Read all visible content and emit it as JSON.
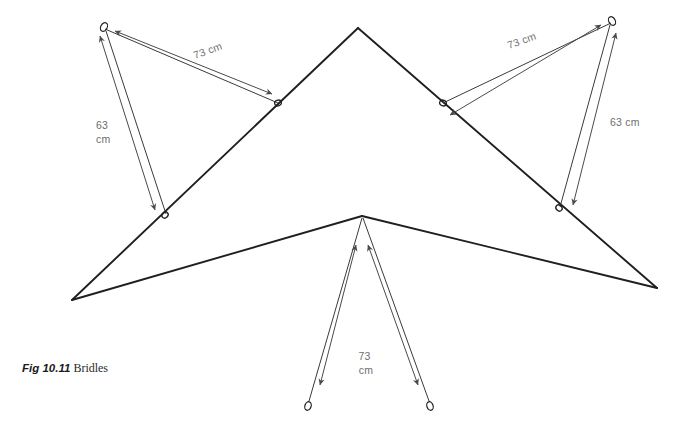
{
  "figure": {
    "label": "Fig 10.11",
    "title": "Bridles",
    "caption_full": "Fig 10.11 Bridles"
  },
  "colors": {
    "background": "#ffffff",
    "outline": "#1f1f1f",
    "bridle_line": "#3a3a3a",
    "dimension_line": "#4a4a4a",
    "dimension_text": "#6e6e6e",
    "caption_label": "#1a1a1a",
    "caption_text": "#2b2b2b"
  },
  "dimensions": {
    "left_upper": {
      "value": "73 cm",
      "number": 73,
      "unit": "cm",
      "lines": [
        "73 cm"
      ],
      "rotation": -20
    },
    "left_lower": {
      "value": "63 cm",
      "number": 63,
      "unit": "cm",
      "lines": [
        "63",
        "cm"
      ],
      "rotation": 0
    },
    "right_upper": {
      "value": "73 cm",
      "number": 73,
      "unit": "cm",
      "lines": [
        "73 cm"
      ],
      "rotation": 20
    },
    "right_lower": {
      "value": "63 cm",
      "number": 63,
      "unit": "cm",
      "lines": [
        "63 cm"
      ],
      "rotation": 0
    },
    "keel": {
      "value": "73 cm",
      "number": 73,
      "unit": "cm",
      "lines": [
        "73",
        "cm"
      ],
      "rotation": 0
    }
  },
  "kite": {
    "name": "delta-kite-outline",
    "apex": {
      "x": 358,
      "y": 28
    },
    "left_wingtip": {
      "x": 72,
      "y": 300
    },
    "right_wingtip": {
      "x": 657,
      "y": 288
    },
    "keel_point": {
      "x": 362,
      "y": 216
    }
  },
  "bridle_points": {
    "left_free_ring": {
      "x": 104,
      "y": 27
    },
    "left_upper_ring": {
      "x": 278,
      "y": 103
    },
    "left_lower_ring": {
      "x": 165,
      "y": 215
    },
    "right_free_ring": {
      "x": 612,
      "y": 21
    },
    "right_upper_ring": {
      "x": 443,
      "y": 103
    },
    "right_lower_ring": {
      "x": 559,
      "y": 208
    },
    "keel_left_loop": {
      "x": 308,
      "y": 406
    },
    "keel_right_loop": {
      "x": 430,
      "y": 406
    }
  }
}
